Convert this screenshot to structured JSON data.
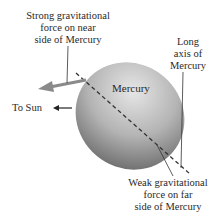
{
  "labels": {
    "strong_force": [
      "Strong gravitational",
      "force on near",
      "side of Mercury"
    ],
    "long_axis": [
      "Long",
      "axis of",
      "Mercury"
    ],
    "planet": "Mercury",
    "to_sun": "To Sun",
    "weak_force": [
      "Weak gravitational",
      "force on far",
      "side of Mercury"
    ]
  },
  "colors": {
    "sphere_light": "#e0e0e0",
    "sphere_dark": "#707070",
    "arrow": "#8a8a8a",
    "line": "#333333"
  }
}
